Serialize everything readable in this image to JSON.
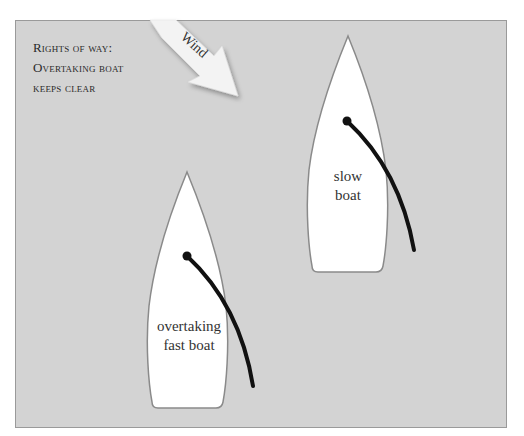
{
  "title": {
    "lines": [
      "Rights of way:",
      "Overtaking boat",
      "keeps clear"
    ]
  },
  "wind": {
    "label": "Wind",
    "icon": "wind-arrow-icon"
  },
  "boats": [
    {
      "id": "slow",
      "label_lines": [
        "slow",
        "boat"
      ]
    },
    {
      "id": "fast",
      "label_lines": [
        "overtaking",
        "fast boat"
      ]
    }
  ],
  "colors": {
    "background": "#d3d3d3",
    "hull": "#ffffff",
    "hull_outline": "#8a8a8a",
    "boom": "#111111",
    "arrow": "#f2f2f2"
  }
}
